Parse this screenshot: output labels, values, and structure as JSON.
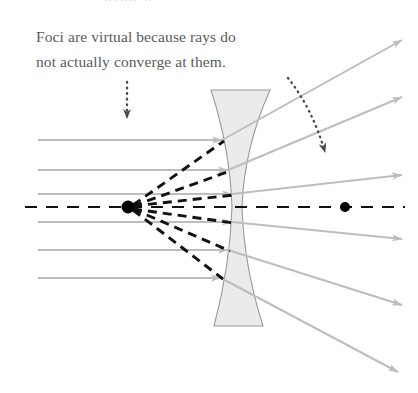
{
  "figure": {
    "caption": "Foci are virtual because rays do\nnot actually converge at them.",
    "ghost_line": "ging g",
    "colors": {
      "background": "#ffffff",
      "caption_text": "#5b5b5b",
      "incoming_ray": "#bdbdbd",
      "outgoing_ray": "#bdbdbd",
      "virtual_ray": "#111111",
      "optical_axis": "#111111",
      "focal_point": "#000000",
      "lens_fill": "#ebebeb",
      "lens_stroke": "#9a9a9a",
      "annotation_arrow": "#4a4a4a"
    },
    "optical_axis": {
      "label": "optical-axis",
      "y": 207,
      "x_start": 25,
      "x_end": 405,
      "dash": "12 9"
    },
    "lens": {
      "label": "biconcave-diverging-lens",
      "top_y": 90,
      "bottom_y": 326,
      "top_left_x": 211,
      "top_right_x": 270,
      "bottom_left_x": 214,
      "bottom_right_x": 263,
      "waist_left_x": 232,
      "waist_right_x": 242,
      "waist_y": 207
    },
    "focal_points": [
      {
        "name": "left-virtual-focus",
        "x": 128,
        "y": 207,
        "r": 6.5
      },
      {
        "name": "right-virtual-focus",
        "x": 345,
        "y": 207,
        "r": 5.0
      }
    ],
    "incoming_rays": [
      {
        "name": "incoming-ray-1",
        "x1": 38,
        "y": 140,
        "x2": 222
      },
      {
        "name": "incoming-ray-2",
        "x1": 38,
        "y": 170,
        "x2": 228
      },
      {
        "name": "incoming-ray-3",
        "x1": 38,
        "y": 194,
        "x2": 232
      },
      {
        "name": "incoming-ray-4",
        "x1": 38,
        "y": 222,
        "x2": 232
      },
      {
        "name": "incoming-ray-5",
        "x1": 38,
        "y": 250,
        "x2": 228
      },
      {
        "name": "incoming-ray-6",
        "x1": 38,
        "y": 278,
        "x2": 221
      }
    ],
    "outgoing_rays": [
      {
        "name": "outgoing-ray-1",
        "x1": 222,
        "y1": 140,
        "x2": 402,
        "y2": 40
      },
      {
        "name": "outgoing-ray-2",
        "x1": 228,
        "y1": 170,
        "x2": 402,
        "y2": 97
      },
      {
        "name": "outgoing-ray-3",
        "x1": 232,
        "y1": 194,
        "x2": 402,
        "y2": 175
      },
      {
        "name": "outgoing-ray-4",
        "x1": 232,
        "y1": 222,
        "x2": 402,
        "y2": 239
      },
      {
        "name": "outgoing-ray-5",
        "x1": 228,
        "y1": 250,
        "x2": 402,
        "y2": 305
      },
      {
        "name": "outgoing-ray-6",
        "x1": 221,
        "y1": 278,
        "x2": 398,
        "y2": 372
      }
    ],
    "virtual_rays": [
      {
        "name": "virtual-ray-1",
        "x1": 133,
        "y1": 205,
        "x2": 224,
        "y2": 141
      },
      {
        "name": "virtual-ray-2",
        "x1": 133,
        "y1": 206,
        "x2": 230,
        "y2": 171
      },
      {
        "name": "virtual-ray-3",
        "x1": 133,
        "y1": 206,
        "x2": 234,
        "y2": 195
      },
      {
        "name": "virtual-ray-4",
        "x1": 133,
        "y1": 209,
        "x2": 234,
        "y2": 223
      },
      {
        "name": "virtual-ray-5",
        "x1": 133,
        "y1": 209,
        "x2": 230,
        "y2": 251
      },
      {
        "name": "virtual-ray-6",
        "x1": 133,
        "y1": 210,
        "x2": 223,
        "y2": 279
      }
    ],
    "annotations": [
      {
        "name": "left-focus-pointer",
        "type": "dotted-arrow-straight",
        "x1": 127,
        "y1": 82,
        "x2": 127,
        "y2": 118
      },
      {
        "name": "right-focus-pointer",
        "type": "dotted-arrow-curved",
        "x1": 288,
        "y1": 78,
        "cx": 312,
        "cy": 108,
        "x2": 325,
        "y2": 152
      }
    ]
  }
}
